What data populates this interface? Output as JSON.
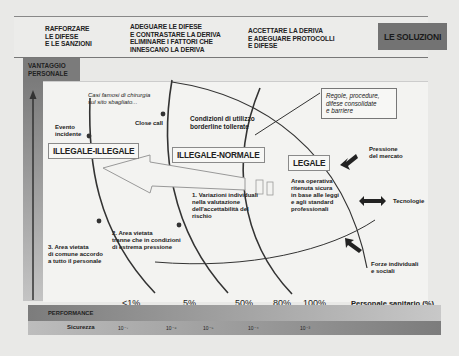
{
  "header": {
    "col1": "RAFFORZARE\nLE DIFESE\nE LE SANZIONI",
    "col2": "ADEGUARE LE DIFESE\nE CONTRASTARE LA DERIVA\nELIMINARE I FATTORI CHE\nINNESCANO LA DERIVA",
    "col3": "ACCETTARE LA DERIVA\nE ADEGUARE PROTOCOLLI\nE DIFESE",
    "solutions_label": "LE SOLUZIONI"
  },
  "y_axis": {
    "label": "VANTAGGIO\nPERSONALE"
  },
  "zones": {
    "illegale_illegale": "ILLEGALE-ILLEGALE",
    "illegale_normale": "ILLEGALE-NORMALE",
    "legale": "LEGALE"
  },
  "annotations": {
    "casi_famosi": "Casi famosi di chirurgia\nsul sito sbagliato...",
    "evento_incidente": "Evento\nincidente",
    "close_call": "Close call",
    "condizioni": "Condizioni di utilizzo\nborderline tollerate",
    "regole": "Regole, procedure,\ndifese consolidate\ne barriere",
    "area_operativa": "Area operativa\nritenuta sicura\nin base alle leggi\ne agli standard\nprofessionali",
    "variazioni": "1. Variazioni individuali\nnella valutazione\ndell'accettabilità del\nrischio",
    "area_vietata_2": "2. Area vietata\ntranne che in condizioni\ndi estrema pressione",
    "area_vietata_3": "3. Area vietata\ndi comune accordo\na tutto il personale"
  },
  "forces": {
    "mercato": "Pressione\ndel mercato",
    "tecnologie": "Tecnologie",
    "individuali": "Forze individuali\ne sociali"
  },
  "x_axis": {
    "label": "Personale sanitario (%)",
    "percents": [
      "<1%",
      "5%",
      "50%",
      "80%",
      "100%"
    ]
  },
  "performance_label": "PERFORMANCE",
  "sicurezza": {
    "label": "Sicurezza",
    "ticks": [
      "10⁻⁷",
      "10⁻⁶",
      "10⁻⁵",
      "10⁻⁴",
      "10⁻³"
    ]
  },
  "colors": {
    "band_dark": "#7b7b7b",
    "band_light": "#c8c8c8",
    "background": "#e9e9e7",
    "plot": "#f3f3f1"
  }
}
